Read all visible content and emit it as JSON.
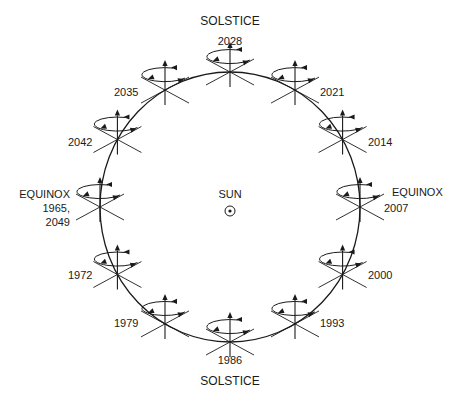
{
  "diagram": {
    "center_label": "SUN",
    "top_title": "SOLSTICE",
    "bottom_title": "SOLSTICE",
    "left_title": "EQUINOX",
    "right_title": "EQUINOX",
    "orbit": {
      "cx": 230,
      "cy": 207,
      "rx": 130,
      "ry": 135
    },
    "positions": [
      {
        "year": "2028",
        "angle_deg": 90
      },
      {
        "year": "2021",
        "angle_deg": 60
      },
      {
        "year": "2014",
        "angle_deg": 30
      },
      {
        "year": "2007",
        "angle_deg": 0
      },
      {
        "year": "2000",
        "angle_deg": -30
      },
      {
        "year": "1993",
        "angle_deg": -60
      },
      {
        "year": "1986",
        "angle_deg": -90
      },
      {
        "year": "1979",
        "angle_deg": -120
      },
      {
        "year": "1972",
        "angle_deg": -150
      },
      {
        "year": "1965, 2049",
        "angle_deg": 180
      },
      {
        "year": "2042",
        "angle_deg": 150
      },
      {
        "year": "2035",
        "angle_deg": 120
      }
    ],
    "labels": {
      "y2028": "2028",
      "y2021": "2021",
      "y2014": "2014",
      "y2007": "2007",
      "y2000": "2000",
      "y1993": "1993",
      "y1986": "1986",
      "y1979": "1979",
      "y1972": "1972",
      "y1965": "1965,",
      "y2049": "2049",
      "y2042": "2042",
      "y2035": "2035"
    },
    "colors": {
      "line": "#1a1a1a",
      "background": "#ffffff"
    }
  }
}
